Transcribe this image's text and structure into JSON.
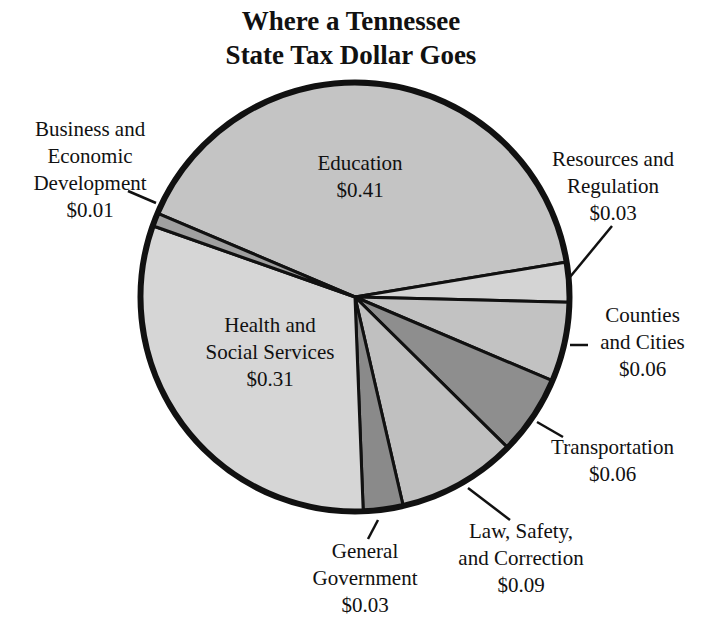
{
  "title": {
    "line1": "Where a Tennessee",
    "line2": "State Tax Dollar Goes"
  },
  "chart_data": {
    "type": "pie",
    "title": "Where a Tennessee State Tax Dollar Goes",
    "categories": [
      "Education",
      "Resources and Regulation",
      "Counties and Cities",
      "Transportation",
      "Law, Safety, and Correction",
      "General Government",
      "Health and Social Services",
      "Business and Economic Development"
    ],
    "values": [
      0.41,
      0.03,
      0.06,
      0.06,
      0.09,
      0.03,
      0.31,
      0.01
    ],
    "value_labels": [
      "$0.41",
      "$0.03",
      "$0.06",
      "$0.06",
      "$0.09",
      "$0.03",
      "$0.31",
      "$0.01"
    ],
    "colors": [
      "#c4c4c4",
      "#d4d4d4",
      "#c2c2c2",
      "#8e8e8e",
      "#c0c0c0",
      "#8a8a8a",
      "#d6d6d6",
      "#a0a0a0"
    ],
    "legend": "none (callout labels)"
  },
  "labels": {
    "education": {
      "l1": "Education",
      "v": "$0.41"
    },
    "resources": {
      "l1": "Resources and",
      "l2": "Regulation",
      "v": "$0.03"
    },
    "counties": {
      "l1": "Counties",
      "l2": "and Cities",
      "v": "$0.06"
    },
    "transportation": {
      "l1": "Transportation",
      "v": "$0.06"
    },
    "law": {
      "l1": "Law, Safety,",
      "l2": "and Correction",
      "v": "$0.09"
    },
    "general": {
      "l1": "General",
      "l2": "Government",
      "v": "$0.03"
    },
    "health": {
      "l1": "Health and",
      "l2": "Social Services",
      "v": "$0.31"
    },
    "business": {
      "l1": "Business and",
      "l2": "Economic",
      "l3": "Development",
      "v": "$0.01"
    }
  }
}
